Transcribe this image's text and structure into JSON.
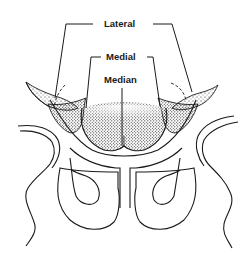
{
  "figure": {
    "labels": {
      "lateral": "Lateral",
      "medial": "Medial",
      "median": "Median"
    },
    "colors": {
      "ink": "#1a1a1a",
      "background": "#ffffff"
    }
  }
}
